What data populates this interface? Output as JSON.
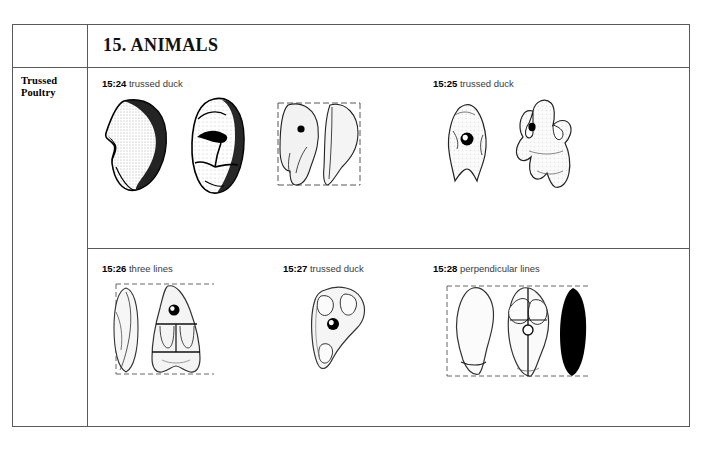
{
  "document": {
    "category_label": "Trussed\nPoultry",
    "category_label_line1": "Trussed",
    "category_label_line2": "Poultry",
    "section_title": "15. ANIMALS"
  },
  "rows": [
    {
      "name": "row-upper",
      "figures": [
        {
          "number": "15:24",
          "description": "trussed duck",
          "views": 3
        },
        {
          "number": "15:25",
          "description": "trussed duck",
          "views": 2
        }
      ]
    },
    {
      "name": "row-lower",
      "figures": [
        {
          "number": "15:26",
          "description": "three lines",
          "views": 2
        },
        {
          "number": "15:27",
          "description": "trussed duck",
          "views": 1
        },
        {
          "number": "15:28",
          "description": "perpendicular lines",
          "views": 3
        }
      ]
    }
  ],
  "colors": {
    "border": "#5a5a5a",
    "ink": "#000000",
    "caption_text": "#3a3a3a",
    "page_background": "#ffffff"
  }
}
